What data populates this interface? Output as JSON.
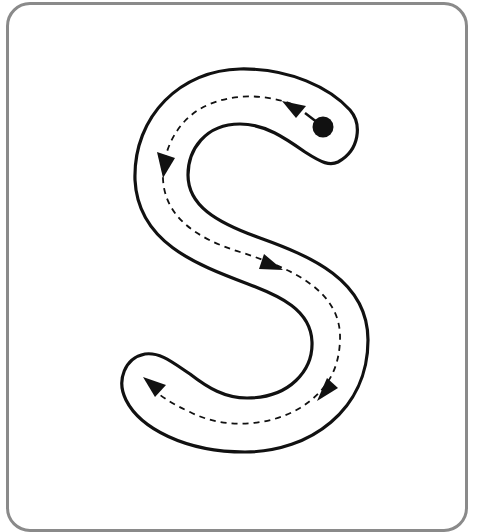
{
  "worksheet": {
    "letter": "S",
    "description": "Letter S tracing guide with start dot and direction arrows"
  },
  "colors": {
    "frame": "#8a8a8a",
    "outline": "#111111",
    "guide": "#111111",
    "background": "#ffffff"
  },
  "guide": {
    "start_marker": "start-dot",
    "arrow_count": 5,
    "arrows": [
      {
        "name": "arrow-1",
        "direction": "up-left"
      },
      {
        "name": "arrow-2",
        "direction": "down"
      },
      {
        "name": "arrow-3",
        "direction": "down-right"
      },
      {
        "name": "arrow-4",
        "direction": "down-left"
      },
      {
        "name": "arrow-5",
        "direction": "up-left"
      }
    ]
  }
}
